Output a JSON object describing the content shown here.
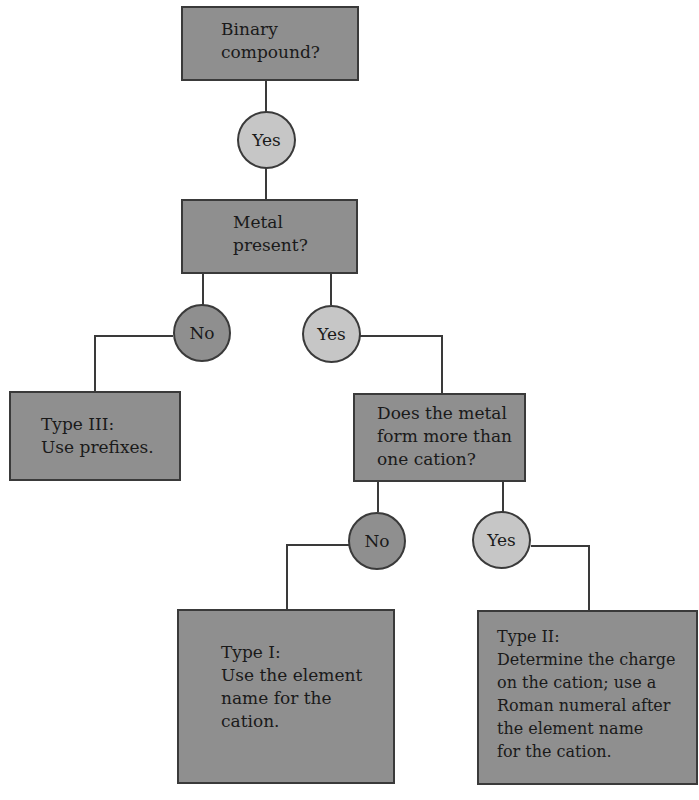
{
  "diagram": {
    "colors": {
      "box_fill": "#8f8f8f",
      "yes_fill": "#c6c6c6",
      "no_fill": "#8f8f8f",
      "line": "#3a3a3a"
    },
    "nodes": {
      "binary": {
        "lines": [
          "Binary",
          "compound?"
        ]
      },
      "metal": {
        "lines": [
          "Metal",
          "present?"
        ]
      },
      "type3": {
        "lines": [
          "Type III:",
          "Use prefixes."
        ]
      },
      "cation": {
        "lines": [
          "Does the metal",
          "form more than",
          "one cation?"
        ]
      },
      "type1": {
        "lines": [
          "Type I:",
          "Use the element",
          "name for the",
          "cation."
        ]
      },
      "type2": {
        "lines": [
          "Type II:",
          "Determine the charge",
          "on the cation; use a",
          "Roman numeral after",
          "the element name",
          "for the cation."
        ]
      }
    },
    "decisions": {
      "binary_yes": "Yes",
      "metal_no": "No",
      "metal_yes": "Yes",
      "cation_no": "No",
      "cation_yes": "Yes"
    }
  }
}
